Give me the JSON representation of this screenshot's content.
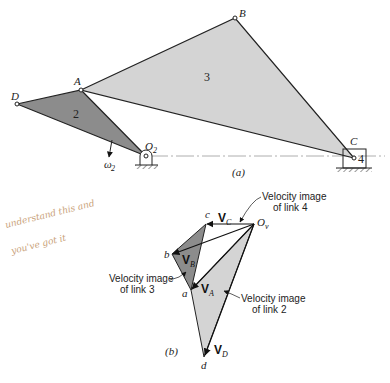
{
  "figure_a": {
    "caption": "(a)",
    "points": {
      "A": {
        "label": "A",
        "x": 81,
        "y": 90
      },
      "B": {
        "label": "B",
        "x": 235,
        "y": 18
      },
      "C": {
        "label": "C",
        "x": 354,
        "y": 158
      },
      "D": {
        "label": "D",
        "x": 17,
        "y": 104
      },
      "O2": {
        "label": "O",
        "sub": "2",
        "x": 146,
        "y": 156
      }
    },
    "link_labels": {
      "link2": "2",
      "link3": "3",
      "link4": "4"
    },
    "omega": {
      "label": "ω",
      "sub": "2"
    },
    "colors": {
      "link2": "#8c8c8c",
      "link3": "#d4d4d4",
      "line": "#222222"
    }
  },
  "figure_b": {
    "caption": "(b)",
    "points": {
      "Ov": {
        "label": "O",
        "sub": "v",
        "x": 254,
        "y": 224
      },
      "a": {
        "label": "a",
        "x": 191,
        "y": 290
      },
      "b": {
        "label": "b",
        "x": 172,
        "y": 254
      },
      "c": {
        "label": "c",
        "x": 206,
        "y": 224
      },
      "d": {
        "label": "d",
        "x": 204,
        "y": 357
      }
    },
    "vectors": {
      "VA": {
        "label": "V",
        "sub": "A"
      },
      "VB": {
        "label": "V",
        "sub": "B"
      },
      "VC": {
        "label": "V",
        "sub": "C"
      },
      "VD": {
        "label": "V",
        "sub": "D"
      }
    },
    "callouts": {
      "link4": {
        "line1": "Velocity image",
        "line2": "of link 4"
      },
      "link3": {
        "line1": "Velocity image",
        "line2": "of link 3"
      },
      "link2": {
        "line1": "Velocity image",
        "line2": "of link 2"
      }
    },
    "colors": {
      "link3_image": "#8c8c8c",
      "link2_image": "#d4d4d4"
    }
  },
  "annotation": {
    "line1": "understand this and",
    "line2": "you've got it",
    "color": "#c9a27a"
  }
}
